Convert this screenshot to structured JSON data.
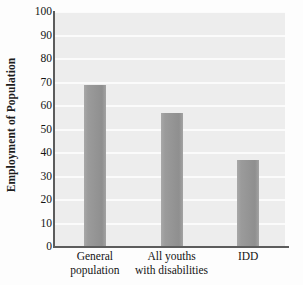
{
  "chart_data": {
    "type": "bar",
    "title": "",
    "xlabel": "",
    "ylabel": "Employment of Population",
    "categories": [
      "General population",
      "All youths with disabilities",
      "IDD"
    ],
    "category_lines": [
      [
        "General",
        "population"
      ],
      [
        "All youths",
        "with disabilities"
      ],
      [
        "IDD",
        ""
      ]
    ],
    "values": [
      69,
      57,
      37
    ],
    "ylim": [
      0,
      100
    ],
    "yticks": [
      0,
      10,
      20,
      30,
      40,
      50,
      60,
      70,
      80,
      90,
      100
    ],
    "ytick_labels": [
      "0",
      "10",
      "20",
      "30",
      "40",
      "50",
      "60",
      "70",
      "80",
      "90",
      "100"
    ],
    "grid": true,
    "legend": false,
    "colors": {
      "bar_fill": "#9a9a9a",
      "plot_background": "#ededed",
      "gridline": "#fbfbfb",
      "axis_line": "#5c5c5c",
      "text": "#141414",
      "figure_background": "#fdfdfd"
    }
  }
}
